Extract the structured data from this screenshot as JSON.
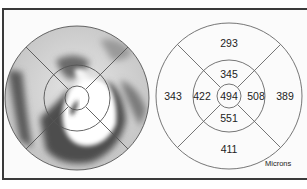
{
  "figure": {
    "left_panel": {
      "type": "thickness-map",
      "description": "grayscale retinal thickness map with ETDRS grid overlay"
    },
    "right_panel": {
      "type": "etdrs-grid",
      "units": "Microns",
      "values": {
        "center": "494",
        "inner_superior": "345",
        "inner_nasal_left": "422",
        "inner_temporal_right": "508",
        "inner_inferior": "551",
        "outer_superior": "293",
        "outer_left": "343",
        "outer_right": "389",
        "outer_inferior": "411"
      }
    },
    "colors": {
      "frame": "#3a3a3a",
      "grid_line": "#555555",
      "text": "#222222"
    }
  }
}
